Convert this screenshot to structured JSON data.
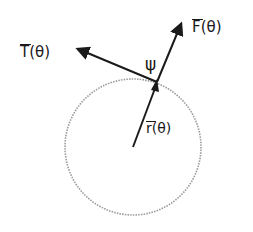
{
  "diagram": {
    "labels": {
      "tangent": {
        "symbol": "T",
        "arg": "(θ)"
      },
      "force": {
        "symbol": "F",
        "arg": "(θ)"
      },
      "radius": {
        "symbol": "r",
        "arg": "(θ)"
      },
      "angle": "ψ"
    },
    "geometry": {
      "circle": {
        "cx": 133,
        "cy": 147,
        "r": 68,
        "style": "dotted"
      },
      "contact_point": [
        157,
        82
      ],
      "center": [
        133,
        147
      ],
      "force_tip": [
        182,
        21
      ],
      "tangent_tip": [
        75,
        47
      ]
    },
    "colors": {
      "ink": "#1a1a1a",
      "circle": "#9a9a9a"
    }
  }
}
